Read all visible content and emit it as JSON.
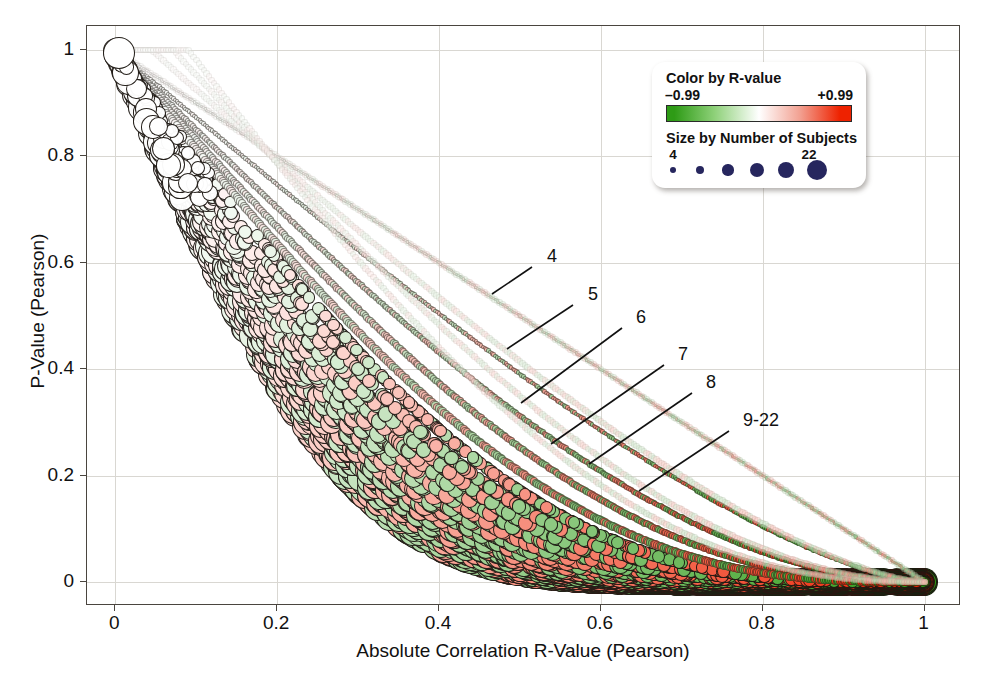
{
  "chart_data": {
    "type": "scatter",
    "title": "",
    "xlabel": "Absolute Correlation R-Value (Pearson)",
    "ylabel": "P-Value (Pearson)",
    "xlim": [
      -0.035,
      1.045
    ],
    "ylim": [
      -0.045,
      1.045
    ],
    "xticks": [
      0,
      0.2,
      0.4,
      0.6,
      0.8,
      1
    ],
    "xticklabels": [
      "0",
      "0.2",
      "0.4",
      "0.6",
      "0.8",
      "1"
    ],
    "yticks": [
      0,
      0.2,
      0.4,
      0.6,
      0.8,
      1
    ],
    "yticklabels": [
      "0",
      "0.2",
      "0.4",
      "0.6",
      "0.8",
      "1"
    ],
    "grid": true,
    "legend_position": "top-right-inside",
    "size_encoding": "Number of Subjects",
    "color_encoding": "R-value",
    "annotations": [
      {
        "label": "4",
        "n": 4,
        "label_x": 547,
        "label_y": 257,
        "line_x1": 532,
        "line_y1": 267,
        "line_x2": 492,
        "line_y2": 294
      },
      {
        "label": "5",
        "n": 5,
        "label_x": 588,
        "label_y": 295,
        "line_x1": 573,
        "line_y1": 305,
        "line_x2": 507,
        "line_y2": 349
      },
      {
        "label": "6",
        "n": 6,
        "label_x": 636,
        "label_y": 318,
        "line_x1": 622,
        "line_y1": 328,
        "line_x2": 521,
        "line_y2": 403
      },
      {
        "label": "7",
        "n": 7,
        "label_x": 678,
        "label_y": 355,
        "line_x1": 664,
        "line_y1": 365,
        "line_x2": 551,
        "line_y2": 444
      },
      {
        "label": "8",
        "n": 8,
        "label_x": 706,
        "label_y": 383,
        "line_x1": 692,
        "line_y1": 393,
        "line_x2": 589,
        "line_y2": 464
      },
      {
        "label": "9-22",
        "n": 9,
        "label_x": 743,
        "label_y": 421,
        "line_x1": 729,
        "line_y1": 431,
        "line_x2": 639,
        "line_y2": 491
      }
    ],
    "curves": [
      {
        "n": 4,
        "label": "4",
        "description": "p-value vs |r| curve for n=4 subjects (df=2)"
      },
      {
        "n": 5,
        "label": "5",
        "description": "p-value vs |r| curve for n=5 subjects (df=3)"
      },
      {
        "n": 6,
        "label": "6",
        "description": "p-value vs |r| curve for n=6 subjects (df=4)"
      },
      {
        "n": 7,
        "label": "7",
        "description": "p-value vs |r| curve for n=7 subjects (df=5)"
      },
      {
        "n": 8,
        "label": "8",
        "description": "p-value vs |r| curve for n=8 subjects (df=6)"
      },
      {
        "n": 22,
        "label": "9-22",
        "description": "p-value vs |r| curves for n=9 through n=22 subjects, merged band"
      }
    ],
    "series_note": "Each point is one correlation: x = |Pearson r|, y = Pearson p-value; marker area scales with number of subjects (4 to 22), marker fill runs green (r = -0.99) through white (r = 0) to red (r = +0.99)."
  },
  "legend": {
    "color_title": "Color by R-value",
    "color_min": "–0.99",
    "color_max": "+0.99",
    "color_low_hex": "#2e9b16",
    "color_mid_hex": "#ffffff",
    "color_high_hex": "#ee2200",
    "size_title": "Size by Number of Subjects",
    "size_min": "4",
    "size_max": "22",
    "size_dot_color_hex": "#26265e",
    "size_dot_count": 6
  },
  "axes": {
    "x_title": "Absolute Correlation R-Value (Pearson)",
    "y_title": "P-Value (Pearson)",
    "x_tick_labels": [
      "0",
      "0.2",
      "0.4",
      "0.6",
      "0.8",
      "1"
    ],
    "y_tick_labels": [
      "0",
      "0.2",
      "0.4",
      "0.6",
      "0.8",
      "1"
    ]
  },
  "annotation_labels": {
    "a4": "4",
    "a5": "5",
    "a6": "6",
    "a7": "7",
    "a8": "8",
    "a9_22": "9-22"
  },
  "colors": {
    "frame": "#4a453f",
    "grid": "#d9d7d2",
    "text": "#111111",
    "background": "#ffffff"
  }
}
